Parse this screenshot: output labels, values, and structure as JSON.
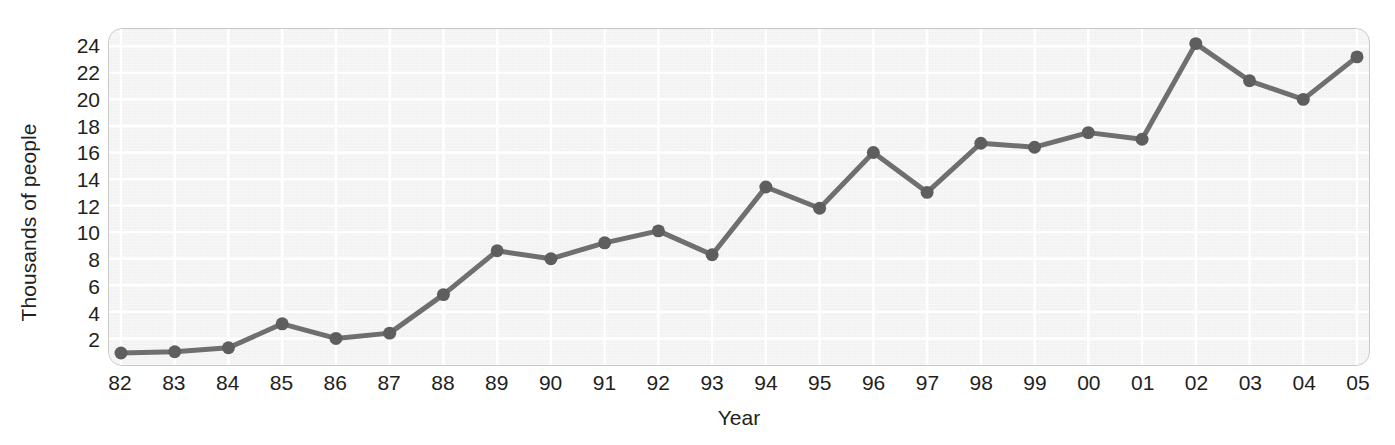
{
  "chart_data": {
    "type": "line",
    "title": "",
    "xlabel": "Year",
    "ylabel": "Thousands of people",
    "categories": [
      "82",
      "83",
      "84",
      "85",
      "86",
      "87",
      "88",
      "89",
      "90",
      "91",
      "92",
      "93",
      "94",
      "95",
      "96",
      "97",
      "98",
      "99",
      "00",
      "01",
      "02",
      "03",
      "04",
      "05"
    ],
    "values": [
      0.9,
      1.0,
      1.3,
      3.1,
      2.0,
      2.4,
      5.3,
      8.6,
      8.0,
      9.2,
      10.1,
      8.3,
      13.4,
      11.8,
      16.0,
      13.0,
      16.7,
      16.4,
      17.5,
      17.0,
      24.2,
      21.4,
      20.0,
      23.2
    ],
    "series": [
      {
        "name": "Thousands of people",
        "values": [
          0.9,
          1.0,
          1.3,
          3.1,
          2.0,
          2.4,
          5.3,
          8.6,
          8.0,
          9.2,
          10.1,
          8.3,
          13.4,
          11.8,
          16.0,
          13.0,
          16.7,
          16.4,
          17.5,
          17.0,
          24.2,
          21.4,
          20.0,
          23.2
        ]
      }
    ],
    "yticks": [
      2,
      4,
      6,
      8,
      10,
      12,
      14,
      16,
      18,
      20,
      22,
      24
    ],
    "ylim": [
      0,
      25.3
    ],
    "xlim": [
      0,
      23
    ],
    "grid": true,
    "legend": false,
    "legend_position": "none",
    "marker": "circle",
    "line_color": "#6f6f6f",
    "marker_color": "#5e5e5e",
    "grid_color": "#ffffff",
    "plot_background": "#f2f2f2",
    "plot_border_color": "#c9c9c9",
    "text_color": "#231f20"
  }
}
